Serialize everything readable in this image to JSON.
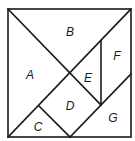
{
  "diagram": {
    "type": "tangram-square",
    "colors": {
      "stroke": "#1a1a1a",
      "background": "#ffffff"
    },
    "pieces": [
      {
        "id": "A",
        "label": "A",
        "x": 30,
        "y": 75
      },
      {
        "id": "B",
        "label": "B",
        "x": 70,
        "y": 32
      },
      {
        "id": "C",
        "label": "C",
        "x": 38,
        "y": 127
      },
      {
        "id": "D",
        "label": "D",
        "x": 70,
        "y": 106
      },
      {
        "id": "E",
        "label": "E",
        "x": 88,
        "y": 78
      },
      {
        "id": "F",
        "label": "F",
        "x": 117,
        "y": 56
      },
      {
        "id": "G",
        "label": "G",
        "x": 113,
        "y": 118
      }
    ]
  }
}
